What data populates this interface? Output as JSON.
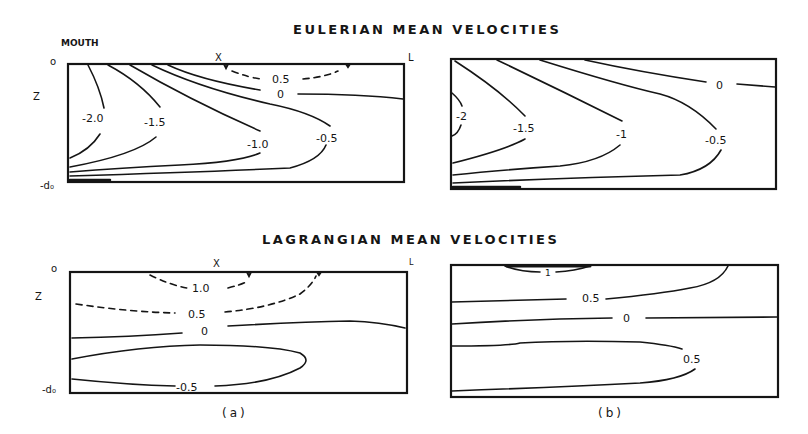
{
  "titles": {
    "eulerian": "EULERIAN MEAN VELOCITIES",
    "lagrangian": "LAGRANGIAN MEAN VELOCITIES"
  },
  "axes": {
    "mouth": "MOUTH",
    "x_marker": "X",
    "l_marker": "L",
    "z": "Z",
    "surface": "o",
    "bottom": "-d₀"
  },
  "captions": {
    "a": "(a)",
    "b": "(b)"
  },
  "panels": {
    "eulerian_a": {
      "contour_labels": [
        "0.5",
        "0",
        "-2.0",
        "-1.5",
        "-1.0",
        "-0.5"
      ]
    },
    "eulerian_b": {
      "contour_labels": [
        "0",
        "-2",
        "-1.5",
        "-1",
        "-0.5"
      ]
    },
    "lagrangian_a": {
      "contour_labels": [
        "1.0",
        "0.5",
        "0",
        "-0.5"
      ]
    },
    "lagrangian_b": {
      "contour_labels": [
        "1",
        "0.5",
        "0",
        "0.5"
      ]
    }
  },
  "colors": {
    "ink": "#151515",
    "background": "#ffffff"
  }
}
